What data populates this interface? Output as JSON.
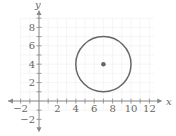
{
  "chart_data": {
    "type": "scatter",
    "title": "",
    "xlabel": "x",
    "ylabel": "y",
    "xlim": [
      -2,
      12
    ],
    "ylim": [
      -2,
      9
    ],
    "grid": true,
    "x_ticks": [
      "-2",
      "2",
      "4",
      "6",
      "8",
      "10",
      "12"
    ],
    "y_ticks": [
      "-2",
      "2",
      "4",
      "6",
      "8"
    ],
    "shapes": [
      {
        "type": "circle",
        "center": [
          7,
          4
        ],
        "radius": 3
      }
    ],
    "points": [
      {
        "x": 7,
        "y": 4,
        "label": "center"
      }
    ]
  },
  "colors": {
    "curve": "#666666",
    "grid": "#eeeeee",
    "axis": "#888888"
  }
}
